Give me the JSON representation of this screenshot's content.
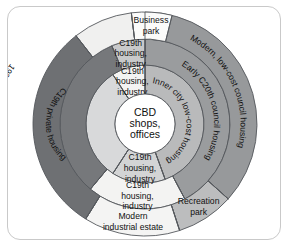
{
  "figure": {
    "type": "concentric-zone-diagram",
    "center_label_line1": "CBD",
    "center_label_line2": "shops,",
    "center_label_line3": "offices",
    "background_color": "#ffffff",
    "frame_color": "#c9c9c9",
    "outline_color": "#55585c"
  },
  "chart_data": {
    "type": "pie",
    "center": "CBD shops, offices",
    "rings": [
      {
        "ring": 1,
        "name": "inner-ring",
        "inner_radius": 30,
        "outer_radius": 59,
        "segments": [
          {
            "label": "Inner city low-cost housing",
            "color": "#b9babb",
            "start_angle": -90,
            "end_angle": 70,
            "text_style": "curved",
            "flip": false
          },
          {
            "label": "C19th housing, industry",
            "color": "#d3d4d5",
            "start_angle": 70,
            "end_angle": 123,
            "text_style": "straight"
          },
          {
            "label": "C19th private housing",
            "color": "#d8d9da",
            "start_angle": 123,
            "end_angle": 237,
            "text_style": "curved",
            "flip": true
          },
          {
            "label": "C19th housing, industry",
            "color": "#f3f3f2",
            "start_angle": 237,
            "end_angle": 270,
            "text_style": "straight"
          }
        ]
      },
      {
        "ring": 2,
        "name": "middle-ring",
        "inner_radius": 59,
        "outer_radius": 85,
        "segments": [
          {
            "label": "Early C20th council housing",
            "color": "#9a9c9e",
            "start_angle": -90,
            "end_angle": 62,
            "text_style": "curved",
            "flip": false
          },
          {
            "label": "C19th housing, industry",
            "color": "#f3f3f2",
            "start_angle": 62,
            "end_angle": 130,
            "text_style": "straight"
          },
          {
            "label": "1930s private housing",
            "color": "#76787b",
            "start_angle": 130,
            "end_angle": 247,
            "text_style": "curved",
            "flip": true
          },
          {
            "label": "C19th housing, industry",
            "color": "#c8c9ca",
            "start_angle": 247,
            "end_angle": 270,
            "text_style": "straight"
          }
        ]
      },
      {
        "ring": 3,
        "name": "outer-ring",
        "inner_radius": 85,
        "outer_radius": 112,
        "segments": [
          {
            "label": "Modern, low-cost council housing",
            "color": "#97999b",
            "start_angle": -90,
            "end_angle": 42,
            "text_style": "curved",
            "flip": false
          },
          {
            "label": "Recreation park",
            "color": "#bcbdbe",
            "start_angle": 42,
            "end_angle": 72,
            "text_style": "straight"
          },
          {
            "label": "Modern industrial estate",
            "color": "#f4f4f3",
            "start_angle": 72,
            "end_angle": 122,
            "text_style": "straight"
          },
          {
            "label": "Modern expensive private housing",
            "color": "#6e7073",
            "start_angle": 122,
            "end_angle": 232,
            "text_style": "curved",
            "flip": true
          },
          {
            "label": "Industrial estate",
            "color": "#f0f0ef",
            "start_angle": 232,
            "end_angle": 263,
            "text_style": "curved",
            "flip": true
          },
          {
            "label": "Business park",
            "color": "#fbfbfa",
            "start_angle": 263,
            "end_angle": 284,
            "text_style": "straight"
          }
        ]
      }
    ],
    "legend": []
  }
}
